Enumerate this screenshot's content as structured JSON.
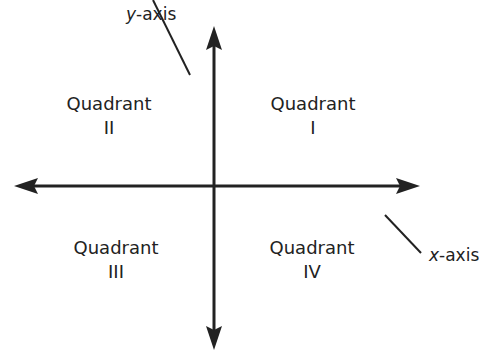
{
  "diagram": {
    "type": "coordinate-plane-quadrants",
    "axes": {
      "y_axis": {
        "var": "y",
        "suffix": "-axis"
      },
      "x_axis": {
        "var": "x",
        "suffix": "-axis"
      }
    },
    "quadrants": [
      {
        "word": "Quadrant",
        "numeral": "I"
      },
      {
        "word": "Quadrant",
        "numeral": "II"
      },
      {
        "word": "Quadrant",
        "numeral": "III"
      },
      {
        "word": "Quadrant",
        "numeral": "IV"
      }
    ],
    "colors": {
      "ink": "#222222",
      "background": "#ffffff"
    }
  }
}
